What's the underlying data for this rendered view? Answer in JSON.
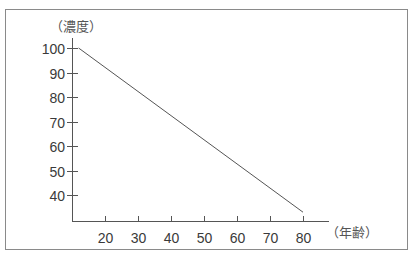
{
  "chart_data": {
    "type": "line",
    "title": "",
    "xlabel": "（年齢）",
    "ylabel": "（濃度）",
    "x_ticks": [
      20,
      30,
      40,
      50,
      60,
      70,
      80
    ],
    "y_ticks": [
      40,
      50,
      60,
      70,
      80,
      90,
      100
    ],
    "xlim": [
      10,
      88
    ],
    "ylim": [
      27,
      100
    ],
    "grid": false,
    "legend": null,
    "series": [
      {
        "name": "濃度",
        "x": [
          12,
          80
        ],
        "y": [
          100,
          33
        ]
      }
    ]
  },
  "colors": {
    "frame": "#8a8a8a",
    "axis": "#555555",
    "line": "#555555"
  }
}
